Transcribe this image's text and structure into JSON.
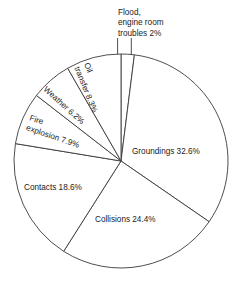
{
  "chart_data": {
    "type": "pie",
    "title": "",
    "subtitle": "",
    "xlabel": "",
    "ylabel": "",
    "legend": "none",
    "grid": false,
    "units": "percent",
    "start_angle_deg": 0,
    "direction": "clockwise",
    "categories": [
      "Flood, engine room troubles",
      "Groundings",
      "Collisions",
      "Contacts",
      "Fire explosion",
      "Weather",
      "Oil transfer"
    ],
    "values": [
      2,
      32.6,
      24.4,
      18.6,
      7.9,
      6.2,
      8.3
    ],
    "slices": [
      {
        "name": "flood-engine-room-troubles",
        "label": "Flood,\nengine room\ntroubles 2%",
        "label_lines": [
          "Flood,",
          "engine room",
          "troubles 2%"
        ],
        "value": 2,
        "value_text": "2%",
        "label_placement": "callout",
        "label_rotation_deg": 0,
        "callout_x": 118,
        "callout_y": 8
      },
      {
        "name": "groundings",
        "label": "Groundings 32.6%",
        "label_lines": [
          "Groundings 32.6%"
        ],
        "value": 32.6,
        "value_text": "32.6%",
        "label_placement": "inside",
        "label_rotation_deg": 0,
        "label_x": 132,
        "label_y": 154,
        "anchor": "start"
      },
      {
        "name": "collisions",
        "label": "Collisions 24.4%",
        "label_lines": [
          "Collisions 24.4%"
        ],
        "value": 24.4,
        "value_text": "24.4%",
        "label_placement": "inside",
        "label_rotation_deg": 0,
        "label_x": 95,
        "label_y": 222,
        "anchor": "start"
      },
      {
        "name": "contacts",
        "label": "Contacts 18.6%",
        "label_lines": [
          "Contacts 18.6%"
        ],
        "value": 18.6,
        "value_text": "18.6%",
        "label_placement": "inside",
        "label_rotation_deg": 0,
        "label_x": 24,
        "label_y": 190,
        "anchor": "start"
      },
      {
        "name": "fire-explosion",
        "label": "Fire explosion 7.9%",
        "label_lines": [
          "Fire",
          "explosion 7.9%"
        ],
        "value": 7.9,
        "value_text": "7.9%",
        "label_placement": "inside-rotated",
        "label_rotation_deg": 19,
        "label_x": 29,
        "label_y": 120,
        "anchor": "start"
      },
      {
        "name": "weather",
        "label": "Weather 6.2%",
        "label_lines": [
          "Weather 6.2%"
        ],
        "value": 6.2,
        "value_text": "6.2%",
        "label_placement": "inside-rotated",
        "label_rotation_deg": 42,
        "label_x": 43,
        "label_y": 90,
        "anchor": "start"
      },
      {
        "name": "oil-transfer",
        "label": "Oil transfer 8.3%",
        "label_lines": [
          "Oil",
          "transfer 8.3%"
        ],
        "value": 8.3,
        "value_text": "8.3%",
        "label_placement": "inside-rotated",
        "label_rotation_deg": 68,
        "label_x": 84,
        "label_y": 64,
        "anchor": "start"
      }
    ],
    "geometry": {
      "center_x": 121,
      "center_y": 161,
      "radius": 107
    },
    "colors": {
      "slice_fill": "#ffffff",
      "slice_stroke": "#3a3a3a",
      "text": "#1a1a1a",
      "background": "#ffffff"
    }
  }
}
